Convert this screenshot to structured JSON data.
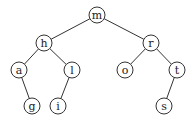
{
  "diagram": {
    "type": "binary-tree",
    "stroke_color": "#333333",
    "node_radius": 8,
    "nodes": [
      {
        "id": "m",
        "label": "m",
        "x": 97,
        "y": 15
      },
      {
        "id": "h",
        "label": "h",
        "x": 44,
        "y": 43
      },
      {
        "id": "r",
        "label": "r",
        "x": 151,
        "y": 43
      },
      {
        "id": "a",
        "label": "a",
        "x": 19,
        "y": 70
      },
      {
        "id": "l",
        "label": "l",
        "x": 72,
        "y": 70
      },
      {
        "id": "o",
        "label": "o",
        "x": 125,
        "y": 70
      },
      {
        "id": "t",
        "label": "t",
        "x": 177,
        "y": 70
      },
      {
        "id": "g",
        "label": "g",
        "x": 32,
        "y": 106
      },
      {
        "id": "i",
        "label": "i",
        "x": 58,
        "y": 106
      },
      {
        "id": "s",
        "label": "s",
        "x": 164,
        "y": 106
      }
    ],
    "edges": [
      {
        "from": "m",
        "to": "h"
      },
      {
        "from": "m",
        "to": "r"
      },
      {
        "from": "h",
        "to": "a"
      },
      {
        "from": "h",
        "to": "l"
      },
      {
        "from": "r",
        "to": "o"
      },
      {
        "from": "r",
        "to": "t"
      },
      {
        "from": "a",
        "to": "g"
      },
      {
        "from": "l",
        "to": "i"
      },
      {
        "from": "t",
        "to": "s"
      }
    ]
  }
}
